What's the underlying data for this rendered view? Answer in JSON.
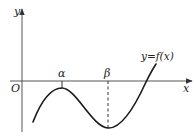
{
  "diagram": {
    "type": "function-graph",
    "axes": {
      "x_label": "x",
      "y_label": "y",
      "origin_label": "O"
    },
    "curve_label": "y=f(x)",
    "points": {
      "alpha_label": "α",
      "beta_label": "β"
    },
    "annotations": [
      "local maximum at x=α (below x-axis)",
      "local minimum at x=β (dashed vertical line)",
      "curve crosses x-axis once, right of β"
    ],
    "colors": {
      "line": "#222222",
      "axis": "#555555",
      "background": "#ffffff"
    }
  }
}
